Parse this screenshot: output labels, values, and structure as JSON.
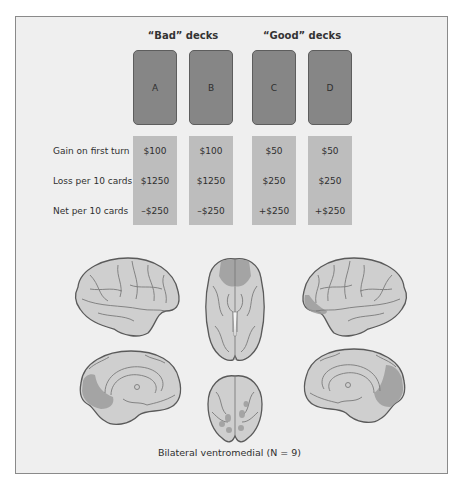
{
  "groups": [
    {
      "label": "“Bad” decks"
    },
    {
      "label": "“Good” decks"
    }
  ],
  "decks": [
    {
      "label": "A",
      "gain_first_turn": "$100",
      "loss_per_10": "$1250",
      "net_per_10": "–$250"
    },
    {
      "label": "B",
      "gain_first_turn": "$100",
      "loss_per_10": "$1250",
      "net_per_10": "–$250"
    },
    {
      "label": "C",
      "gain_first_turn": "$50",
      "loss_per_10": "$250",
      "net_per_10": "+$250"
    },
    {
      "label": "D",
      "gain_first_turn": "$50",
      "loss_per_10": "$250",
      "net_per_10": "+$250"
    }
  ],
  "rows": [
    {
      "label": "Gain on first turn"
    },
    {
      "label": "Loss per 10 cards"
    },
    {
      "label": "Net per 10 cards"
    }
  ],
  "brain_views": [
    {
      "name": "left-lateral"
    },
    {
      "name": "ventral"
    },
    {
      "name": "right-lateral"
    },
    {
      "name": "left-medial"
    },
    {
      "name": "frontal"
    },
    {
      "name": "right-medial"
    }
  ],
  "caption": "Bilateral ventromedial (N = 9)",
  "colors": {
    "background": "#efefef",
    "card": "#868686",
    "value_cell": "#bdbdbd",
    "brain": "#cfcfcf",
    "lesion": "#9c9c9c"
  }
}
